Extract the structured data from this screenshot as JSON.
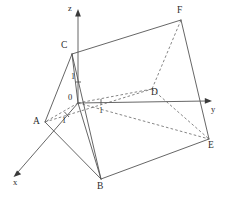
{
  "figure": {
    "kind": "geometry-diagram",
    "width": 227,
    "height": 199,
    "background_color": "#ffffff",
    "line_color": "#555555",
    "text_color": "#2b2b2b"
  },
  "axes": {
    "origin_label": "0",
    "x": {
      "label": "x",
      "direction": "down-left",
      "from": [
        78,
        103
      ],
      "to": [
        14,
        176
      ],
      "label_pos": [
        14,
        180
      ],
      "tick_label": "1",
      "tick_label_pos": [
        62,
        119
      ]
    },
    "y": {
      "label": "y",
      "direction": "right",
      "from": [
        78,
        103
      ],
      "to": [
        211,
        101
      ],
      "label_pos": [
        212,
        106
      ],
      "tick_label": "1",
      "tick_label_pos": [
        98,
        110
      ],
      "tick_at": [
        101,
        101
      ]
    },
    "z": {
      "label": "z",
      "direction": "up",
      "from": [
        78,
        103
      ],
      "to": [
        78,
        11
      ],
      "label_pos": [
        69,
        6
      ],
      "tick_label": "1",
      "tick_label_pos": [
        71,
        78
      ],
      "tick_at": [
        78,
        82
      ]
    }
  },
  "vertices": [
    {
      "id": "A",
      "label": "A",
      "point": [
        45,
        122
      ],
      "label_pos": [
        34,
        121
      ],
      "hidden": false
    },
    {
      "id": "B",
      "label": "B",
      "point": [
        101,
        179
      ],
      "label_pos": [
        98,
        182
      ],
      "hidden": false
    },
    {
      "id": "C",
      "label": "C",
      "point": [
        72,
        54
      ],
      "label_pos": [
        62,
        44
      ],
      "hidden": false
    },
    {
      "id": "D",
      "label": "D",
      "point": [
        152,
        89
      ],
      "label_pos": [
        152,
        90
      ],
      "hidden": true
    },
    {
      "id": "E",
      "label": "E",
      "point": [
        209,
        139
      ],
      "label_pos": [
        209,
        142
      ],
      "hidden": false
    },
    {
      "id": "F",
      "label": "F",
      "point": [
        181,
        20
      ],
      "label_pos": [
        178,
        9
      ],
      "hidden": false
    }
  ],
  "edges": [
    {
      "from": "A",
      "to": "B",
      "style": "solid"
    },
    {
      "from": "B",
      "to": "C",
      "style": "solid"
    },
    {
      "from": "C",
      "to": "A",
      "style": "solid"
    },
    {
      "from": "D",
      "to": "E",
      "style": "dashed"
    },
    {
      "from": "E",
      "to": "F",
      "style": "solid"
    },
    {
      "from": "F",
      "to": "D",
      "style": "dashed"
    },
    {
      "from": "A",
      "to": "D",
      "style": "dashed"
    },
    {
      "from": "B",
      "to": "E",
      "style": "solid"
    },
    {
      "from": "C",
      "to": "F",
      "style": "solid"
    }
  ],
  "extra_segments": [
    {
      "name": "origin-to-A",
      "from": [
        78,
        103
      ],
      "to": [
        45,
        122
      ],
      "style": "dashed"
    },
    {
      "name": "origin-to-B",
      "from": [
        78,
        103
      ],
      "to": [
        101,
        179
      ],
      "style": "solid"
    },
    {
      "name": "origin-to-C",
      "from": [
        78,
        103
      ],
      "to": [
        72,
        54
      ],
      "style": "solid"
    },
    {
      "name": "origin-to-D",
      "from": [
        78,
        103
      ],
      "to": [
        152,
        89
      ],
      "style": "dashed"
    },
    {
      "name": "origin-to-E",
      "from": [
        78,
        103
      ],
      "to": [
        209,
        139
      ],
      "style": "dashed"
    }
  ]
}
